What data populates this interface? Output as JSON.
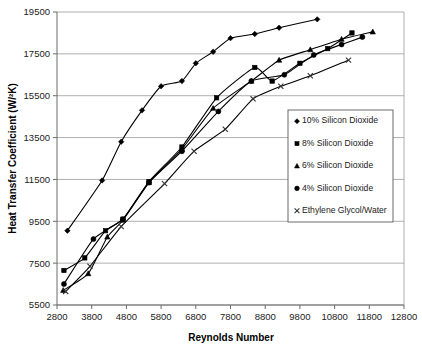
{
  "chart_data": {
    "type": "line",
    "title": "",
    "xlabel": "Reynolds Number",
    "ylabel": "Heat Transfer Coefficient (W/²K)",
    "xlim": [
      2800,
      12800
    ],
    "ylim": [
      5500,
      19500
    ],
    "xticks": [
      2800,
      3800,
      4800,
      5800,
      6800,
      7800,
      8800,
      9800,
      10800,
      11800,
      12800
    ],
    "yticks": [
      5500,
      7500,
      9500,
      11500,
      13500,
      15500,
      17500,
      19500
    ],
    "xtick_labels": [
      "2800",
      "3800",
      "4800",
      "5800",
      "6800",
      "7800",
      "8800",
      "9800",
      "10800",
      "11800",
      "12800"
    ],
    "ytick_labels": [
      "5500",
      "7500",
      "9500",
      "11500",
      "13500",
      "15500",
      "17500",
      "19500"
    ],
    "grid": "horizontal",
    "legend_position": "center-right",
    "series": [
      {
        "name": "10% Silicon Dioxide",
        "marker": "diamond",
        "color": "#000000",
        "x": [
          3100,
          4100,
          4650,
          5250,
          5800,
          6400,
          6800,
          7300,
          7800,
          8500,
          9200,
          10300
        ],
        "y": [
          9050,
          11450,
          13300,
          14800,
          15950,
          16200,
          17050,
          17600,
          18250,
          18450,
          18750,
          19150
        ]
      },
      {
        "name": "8% Silicon Dioxide",
        "marker": "square",
        "color": "#000000",
        "x": [
          3000,
          3600,
          4200,
          4700,
          5450,
          6400,
          7400,
          8500,
          9000,
          9800,
          10600,
          11300
        ],
        "y": [
          7150,
          7750,
          9050,
          9600,
          11400,
          13050,
          15400,
          16850,
          16200,
          17050,
          17750,
          18500
        ]
      },
      {
        "name": "6% Silicon Dioxide",
        "marker": "triangle",
        "color": "#000000",
        "x": [
          2980,
          3700,
          4250,
          4700,
          5450,
          6400,
          7300,
          8400,
          9200,
          10100,
          11000,
          11900
        ],
        "y": [
          6200,
          7000,
          8750,
          9550,
          11350,
          12950,
          14900,
          16200,
          17200,
          17700,
          18200,
          18550
        ]
      },
      {
        "name": "4% Silicon Dioxide",
        "marker": "circle",
        "color": "#000000",
        "x": [
          3000,
          3850,
          4700,
          5450,
          6400,
          7450,
          8400,
          9350,
          10200,
          11000,
          11600
        ],
        "y": [
          6500,
          8650,
          9600,
          11350,
          12850,
          14750,
          16200,
          16500,
          17450,
          17950,
          18300
        ]
      },
      {
        "name": "Ethylene Glycol/Water",
        "marker": "x",
        "color": "#333333",
        "x": [
          3050,
          3750,
          4650,
          5900,
          6750,
          7650,
          8450,
          9250,
          10100,
          11200
        ],
        "y": [
          6150,
          7350,
          9250,
          11300,
          12850,
          13900,
          15350,
          15950,
          16450,
          17200
        ]
      }
    ]
  },
  "legend": {
    "entries": [
      {
        "label": "10% Silicon Dioxide",
        "marker": "diamond"
      },
      {
        "label": "8% Silicon Dioxide",
        "marker": "square"
      },
      {
        "label": "6% Silicon Dioxide",
        "marker": "triangle"
      },
      {
        "label": "4% Silicon Dioxide",
        "marker": "circle"
      },
      {
        "label": "Ethylene Glycol/Water",
        "marker": "x"
      }
    ]
  }
}
